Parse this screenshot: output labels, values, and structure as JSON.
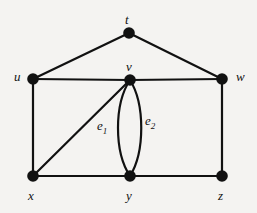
{
  "figure": {
    "background_color": "#f4f3f1",
    "ink_color": "#111111",
    "width": 257,
    "height": 213
  },
  "graph": {
    "vertex_radius": 5.8,
    "edge_width": 2.2,
    "vertices": [
      {
        "id": "t",
        "label": "t",
        "x": 129,
        "y": 33,
        "label_x": 125,
        "label_y": 13
      },
      {
        "id": "u",
        "label": "u",
        "x": 33,
        "y": 79,
        "label_x": 14,
        "label_y": 70
      },
      {
        "id": "v",
        "label": "v",
        "x": 130,
        "y": 80,
        "label_x": 126,
        "label_y": 60
      },
      {
        "id": "w",
        "label": "w",
        "x": 222,
        "y": 79,
        "label_x": 236,
        "label_y": 70
      },
      {
        "id": "x",
        "label": "x",
        "x": 33,
        "y": 176,
        "label_x": 28,
        "label_y": 189
      },
      {
        "id": "y",
        "label": "y",
        "x": 130,
        "y": 176,
        "label_x": 126,
        "label_y": 189
      },
      {
        "id": "z",
        "label": "z",
        "x": 222,
        "y": 176,
        "label_x": 218,
        "label_y": 189
      }
    ],
    "edges": [
      {
        "id": "tu",
        "from": "t",
        "to": "u",
        "kind": "straight"
      },
      {
        "id": "tw",
        "from": "t",
        "to": "w",
        "kind": "straight"
      },
      {
        "id": "uv",
        "from": "u",
        "to": "v",
        "kind": "straight"
      },
      {
        "id": "vw",
        "from": "v",
        "to": "w",
        "kind": "straight"
      },
      {
        "id": "ux",
        "from": "u",
        "to": "x",
        "kind": "straight"
      },
      {
        "id": "wz",
        "from": "w",
        "to": "z",
        "kind": "straight"
      },
      {
        "id": "xy",
        "from": "x",
        "to": "y",
        "kind": "straight"
      },
      {
        "id": "yz",
        "from": "y",
        "to": "z",
        "kind": "straight"
      },
      {
        "id": "xv",
        "from": "x",
        "to": "v",
        "kind": "straight"
      },
      {
        "id": "e1",
        "from": "v",
        "to": "y",
        "kind": "curve",
        "bow": -13,
        "label": "e",
        "sub": "1"
      },
      {
        "id": "e2",
        "from": "v",
        "to": "y",
        "kind": "curve",
        "bow": 12,
        "label": "e",
        "sub": "2"
      }
    ],
    "edge_labels": [
      {
        "id": "e1",
        "label": "e",
        "sub": "1",
        "x": 97,
        "y": 119
      },
      {
        "id": "e2",
        "label": "e",
        "sub": "2",
        "x": 145,
        "y": 114
      }
    ]
  }
}
